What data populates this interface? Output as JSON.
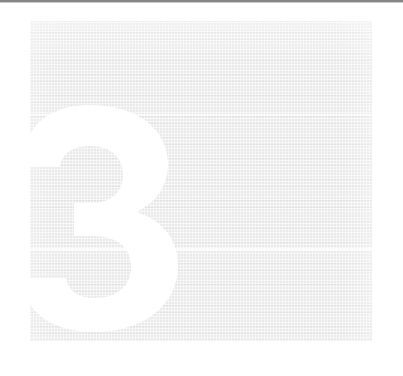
{
  "page": {
    "kind": "scanned-book-page",
    "width": 403,
    "height": 376,
    "background_color": "#ffffff"
  },
  "scan_artifacts": {
    "top_edge_label": "page top scan edge",
    "top_edge_color": "#6f7173",
    "band_upper_label": "upper scan band",
    "band_lower_label": "lower scan band",
    "band_color": "#fbfbfb"
  },
  "tint_panel": {
    "label": "chapter tint panel",
    "fill_color": "#eaeaea",
    "left": 30,
    "top": 21,
    "width": 342,
    "height": 320
  },
  "chapter": {
    "number": "3",
    "numeral_color": "#ffffff",
    "numeral_label": "chapter number three",
    "alt_text": "Chapter 3"
  }
}
